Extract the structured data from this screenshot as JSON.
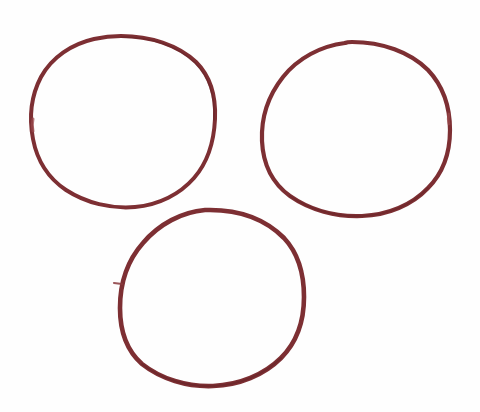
{
  "image": {
    "title": "Three hand-drawn circles",
    "width": 480,
    "height": 412,
    "background_color": "#fefefe",
    "medium": "hand-drawn ink / marker sketch",
    "ink_color": "#7d2f33",
    "ink_color_light": "#9a4a4d",
    "ink_color_dark": "#652326",
    "shape_count": 3,
    "arrangement": "triangular cluster: two circles on top row, one circle below centered-left"
  },
  "shapes": [
    {
      "id": "circle-top-left",
      "name": "top-left-circle",
      "label": "Top-left circle",
      "center_x": 123,
      "center_y": 122,
      "radius_x": 92,
      "radius_y": 86,
      "bbox": [
        31,
        36,
        215,
        208
      ],
      "stroke_width": 4.0,
      "stroke_color": "#7d2f33",
      "closure": "closed",
      "notes": "slightly flattened at top-right, small pen gap on left side near y=120"
    },
    {
      "id": "circle-top-right",
      "name": "top-right-circle",
      "label": "Top-right circle",
      "center_x": 356,
      "center_y": 129,
      "radius_x": 94,
      "radius_y": 87,
      "bbox": [
        262,
        42,
        450,
        216
      ],
      "stroke_width": 4.2,
      "stroke_color": "#7d2f33",
      "closure": "closed",
      "notes": "slightly wider than tall, small nick on right edge near y=120"
    },
    {
      "id": "circle-bottom",
      "name": "bottom-circle",
      "label": "Bottom circle",
      "center_x": 212,
      "center_y": 298,
      "radius_x": 92,
      "radius_y": 88,
      "bbox": [
        120,
        210,
        304,
        386
      ],
      "stroke_width": 4.6,
      "stroke_color": "#7d2f33",
      "closure": "closed",
      "notes": "heaviest stroke of the three; short pen-start spur protrudes to the left at approximately (116, 284)"
    }
  ],
  "marks": [
    {
      "id": "pen-start-spur",
      "name": "pen-start-spur",
      "label": "Pen start spur on bottom circle",
      "x": 116,
      "y": 284,
      "length": 8,
      "stroke_color": "#8a3a3d"
    }
  ]
}
